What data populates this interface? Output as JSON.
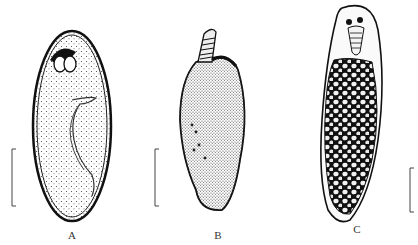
{
  "figure": {
    "panels": [
      {
        "id": "A",
        "label": "A",
        "description": "oval ciliate with dotted cytoplasm, cytostome at anterior, curved macronucleus"
      },
      {
        "id": "B",
        "label": "B",
        "description": "spindle-shaped ciliate with spiny cilia, apical striated structure"
      },
      {
        "id": "C",
        "label": "C",
        "description": "elongate ciliate filled with dense granules / food vacuoles"
      }
    ],
    "scale_bars": [
      {
        "panel": "A"
      },
      {
        "panel": "B"
      },
      {
        "panel": "C"
      }
    ]
  }
}
